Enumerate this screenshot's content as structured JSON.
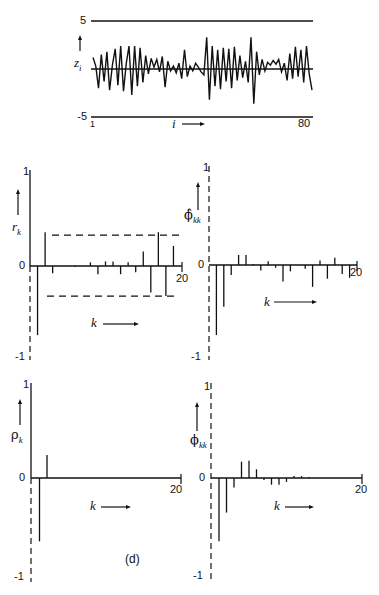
{
  "figure": {
    "label": "(d)",
    "top": {
      "y_max_label": "5",
      "y_min_label": "-5",
      "x_start_label": "1",
      "x_end_label": "80",
      "x_axis_label": "i",
      "y_axis_label": "z",
      "y_axis_sub": "i"
    },
    "panels": [
      {
        "name": "sample-acf",
        "y_label": "r",
        "y_sub": "k",
        "tick_top": "1",
        "tick_zero": "0",
        "tick_bottom": "-1",
        "x_end": "20",
        "x_label": "k"
      },
      {
        "name": "sample-pacf",
        "y_label": "ϕ̂",
        "y_sub": "kk",
        "tick_top": "1",
        "tick_zero": "0",
        "tick_bottom": "-1",
        "x_end": "20",
        "x_label": "k"
      },
      {
        "name": "theoretical-acf",
        "y_label": "ρ",
        "y_sub": "k",
        "tick_top": "1",
        "tick_zero": "0",
        "tick_bottom": "-1",
        "x_end": "20",
        "x_label": "k"
      },
      {
        "name": "theoretical-pacf",
        "y_label": "ϕ",
        "y_sub": "kk",
        "tick_top": "1",
        "tick_zero": "0",
        "tick_bottom": "-1",
        "x_end": "20",
        "x_label": "k"
      }
    ]
  },
  "chart_data": [
    {
      "type": "line",
      "title": "",
      "xlabel": "i",
      "ylabel": "z_i",
      "xlim": [
        1,
        80
      ],
      "ylim": [
        -5,
        5
      ],
      "grid": false,
      "x": [
        1,
        2,
        3,
        4,
        5,
        6,
        7,
        8,
        9,
        10,
        11,
        12,
        13,
        14,
        15,
        16,
        17,
        18,
        19,
        20,
        21,
        22,
        23,
        24,
        25,
        26,
        27,
        28,
        29,
        30,
        31,
        32,
        33,
        34,
        35,
        36,
        37,
        38,
        39,
        40,
        41,
        42,
        43,
        44,
        45,
        46,
        47,
        48,
        49,
        50,
        51,
        52,
        53,
        54,
        55,
        56,
        57,
        58,
        59,
        60,
        61,
        62,
        63,
        64,
        65,
        66,
        67,
        68,
        69,
        70,
        71,
        72,
        73,
        74,
        75,
        76,
        77,
        78,
        79,
        80
      ],
      "values": [
        1.2,
        0.3,
        -2.0,
        1.5,
        -1.3,
        1.8,
        -2.2,
        0.4,
        2.1,
        -1.7,
        2.4,
        -2.3,
        0.6,
        2.4,
        -2.7,
        2.4,
        -1.8,
        2.2,
        -1.4,
        1.4,
        -0.5,
        1.1,
        0.2,
        1.0,
        -0.3,
        1.3,
        -1.9,
        0.8,
        -0.2,
        0.3,
        -0.4,
        0.6,
        -1.0,
        2.0,
        -0.8,
        0.3,
        -0.2,
        0.6,
        0.2,
        -0.3,
        -0.6,
        3.3,
        -3.2,
        2.4,
        -1.8,
        2.0,
        -2.1,
        2.2,
        -1.3,
        2.1,
        -2.0,
        2.3,
        -1.2,
        1.4,
        -0.9,
        0.8,
        -1.4,
        3.3,
        -3.6,
        1.8,
        -0.6,
        1.0,
        -0.2,
        0.7,
        0.4,
        0.9,
        0.5,
        1.0,
        -0.3,
        0.6,
        -1.2,
        1.6,
        -1.0,
        2.3,
        -0.8,
        2.0,
        -1.4,
        2.4,
        -0.5,
        -2.2
      ]
    },
    {
      "type": "bar",
      "title": "",
      "xlabel": "k",
      "ylabel": "r_k",
      "xlim": [
        0,
        20
      ],
      "ylim": [
        -1,
        1
      ],
      "categories": [
        1,
        2,
        3,
        4,
        5,
        6,
        7,
        8,
        9,
        10,
        11,
        12,
        13,
        14,
        15,
        16,
        17,
        18,
        19
      ],
      "values": [
        -0.76,
        0.37,
        -0.08,
        0.0,
        0.0,
        -0.01,
        0.0,
        0.04,
        -0.09,
        0.05,
        0.05,
        -0.09,
        0.04,
        -0.07,
        0.16,
        -0.29,
        0.37,
        -0.33,
        0.22
      ],
      "bands": [
        0.34,
        -0.33
      ]
    },
    {
      "type": "bar",
      "title": "",
      "xlabel": "k",
      "ylabel": "ϕ̂_kk",
      "xlim": [
        0,
        20
      ],
      "ylim": [
        -1,
        1
      ],
      "categories": [
        1,
        2,
        3,
        4,
        5,
        6,
        7,
        8,
        9,
        10,
        11,
        12,
        13,
        14,
        15,
        16,
        17,
        18,
        19
      ],
      "values": [
        -0.77,
        -0.46,
        -0.11,
        0.11,
        0.11,
        0.01,
        -0.06,
        0.04,
        -0.03,
        -0.18,
        -0.07,
        0.0,
        -0.04,
        -0.24,
        0.05,
        -0.15,
        0.08,
        -0.1,
        -0.14
      ]
    },
    {
      "type": "bar",
      "title": "",
      "xlabel": "k",
      "ylabel": "ρ_k",
      "xlim": [
        0,
        20
      ],
      "ylim": [
        -1,
        1
      ],
      "categories": [
        1,
        2
      ],
      "values": [
        -0.66,
        0.24
      ]
    },
    {
      "type": "bar",
      "title": "",
      "xlabel": "k",
      "ylabel": "ϕ_kk",
      "xlim": [
        0,
        20
      ],
      "ylim": [
        -1,
        1
      ],
      "categories": [
        1,
        2,
        3,
        4,
        5,
        6,
        7,
        8,
        9,
        10,
        11,
        12,
        13
      ],
      "values": [
        -0.66,
        -0.36,
        -0.1,
        0.17,
        0.18,
        0.09,
        -0.02,
        -0.07,
        -0.07,
        -0.04,
        0.02,
        0.02,
        0.01
      ]
    }
  ]
}
